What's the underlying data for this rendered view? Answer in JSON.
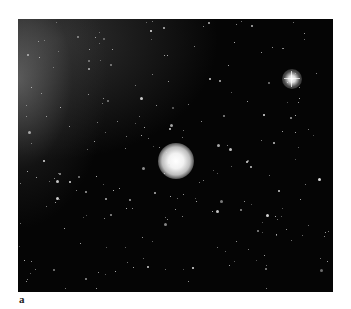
{
  "figure": {
    "panel_label": "a",
    "background_color": "#050505",
    "comet": {
      "x": 157,
      "y": 141,
      "radius": 15
    },
    "bright_star": {
      "x": 274,
      "y": 60,
      "radius": 9
    }
  }
}
